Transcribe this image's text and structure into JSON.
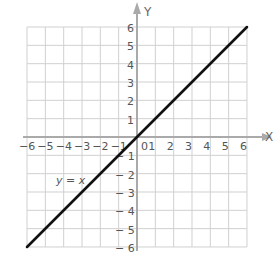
{
  "chart_data": {
    "type": "line",
    "title": "",
    "xlabel": "X",
    "ylabel": "Y",
    "xlim": [
      -6,
      6
    ],
    "ylim": [
      -6,
      6
    ],
    "grid": true,
    "x_ticks": [
      "-6",
      "-5",
      "-4",
      "-3",
      "-2",
      "-1",
      "0",
      "1",
      "2",
      "3",
      "4",
      "5",
      "6"
    ],
    "y_ticks": [
      "-6",
      "-5",
      "-4",
      "-3",
      "-2",
      "-1",
      "1",
      "2",
      "3",
      "4",
      "5",
      "6"
    ],
    "series": [
      {
        "name": "y = x",
        "x": [
          -6,
          6
        ],
        "y": [
          -6,
          6
        ]
      }
    ],
    "annotations": [
      {
        "text": "y = x",
        "x": -4.5,
        "y": -1.8
      }
    ],
    "colors": {
      "grid": "#d0d0d0",
      "axis": "#aaaaaa",
      "line": "#111111"
    }
  },
  "labels": {
    "x_axis": "X",
    "y_axis": "Y",
    "equation": "y = x",
    "origin": "0"
  }
}
